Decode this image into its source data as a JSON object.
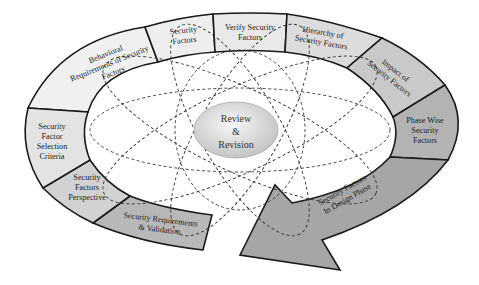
{
  "diagram": {
    "title": "",
    "center": {
      "lines": [
        "Review",
        "&",
        "Revision"
      ]
    },
    "segments": [
      {
        "id": "security-factors",
        "lines": [
          "Security",
          "Factors"
        ],
        "fill": "#eeeeee"
      },
      {
        "id": "verify-security-factors",
        "lines": [
          "Verify Security",
          "Factors"
        ],
        "fill": "#e9e9e9"
      },
      {
        "id": "hierarchy-of-security-factors",
        "lines": [
          "Hierarchy of",
          "Security Factors"
        ],
        "fill": "#dcdcdc"
      },
      {
        "id": "impact-of-security-factors",
        "lines": [
          "Impact of",
          "Security Factors"
        ],
        "fill": "#c9c9c9"
      },
      {
        "id": "phase-wise-security-factors",
        "lines": [
          "Phase Wise",
          "Security",
          "Factors"
        ],
        "fill": "#b3b3b3"
      },
      {
        "id": "security-factors-in-design-phase",
        "lines": [
          "Security Factors",
          "In Design Phase"
        ],
        "fill": "#a6a6a6"
      },
      {
        "id": "security-requirements-validation",
        "lines": [
          "Security Requirements",
          "& Validation"
        ],
        "fill": "#b8b8b8"
      },
      {
        "id": "security-factors-perspective",
        "lines": [
          "Security",
          "Factors",
          "Perspective"
        ],
        "fill": "#d2d2d2"
      },
      {
        "id": "security-factor-selection-criteria",
        "lines": [
          "Security",
          "Factor",
          "Selection",
          "Criteria"
        ],
        "fill": "#e3e3e3"
      },
      {
        "id": "behavioral-requirements",
        "lines": [
          "Behavioral",
          "Requirements of Security",
          "Factors"
        ],
        "fill": "#f0f0f0"
      }
    ],
    "colors": {
      "outline": "#1a1a1a",
      "dashed": "#333333",
      "center_fill_light": "#f4f4f4",
      "center_fill_dark": "#c8c8c8",
      "arrow": "#a2a2a2"
    }
  }
}
